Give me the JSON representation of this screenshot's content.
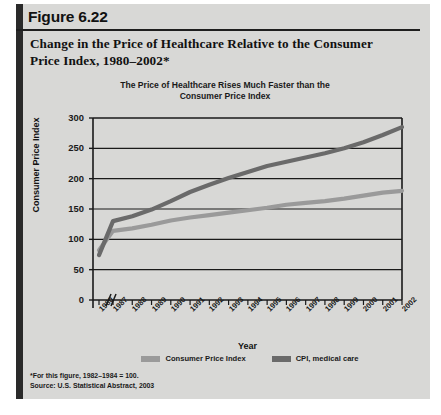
{
  "figure": {
    "number": "Figure 6.22",
    "caption": "Change in the Price of Healthcare Relative to the Consumer Price Index, 1980–2002*"
  },
  "chart_title_line1": "The Price of Healthcare Rises Much Faster than the",
  "chart_title_line2": "Consumer Price Index",
  "footnotes": {
    "note": "*For this figure, 1982–1984 = 100.",
    "source": "Source: U.S. Statistical Abstract, 2003"
  },
  "colors": {
    "panel_background": "#d8d8d6",
    "spine": "#2a2a2a",
    "cpi_line": "#9a9a9a",
    "medical_line": "#6a6a6a",
    "axis": "#1a1a1a",
    "text": "#111111"
  },
  "chart_data": {
    "type": "line",
    "title": "The Price of Healthcare Rises Much Faster than the Consumer Price Index",
    "xlabel": "Year",
    "ylabel": "Consumer Price Index",
    "ylim": [
      0,
      300
    ],
    "yticks": [
      0,
      50,
      100,
      150,
      200,
      250,
      300
    ],
    "grid": true,
    "grid_axis": "y",
    "axis_break_after_first_tick": true,
    "legend_position": "bottom",
    "categories": [
      "1980",
      "1987",
      "1988",
      "1989",
      "1990",
      "1991",
      "1992",
      "1993",
      "1994",
      "1995",
      "1996",
      "1997",
      "1998",
      "1999",
      "2000",
      "2001",
      "2002"
    ],
    "series": [
      {
        "name": "Consumer Price Index",
        "color": "#9a9a9a",
        "values": [
          82,
          114,
          118,
          124,
          131,
          136,
          140,
          144,
          148,
          152,
          157,
          160,
          163,
          167,
          172,
          177,
          180
        ]
      },
      {
        "name": "CPI, medical care",
        "color": "#6a6a6a",
        "values": [
          74,
          130,
          138,
          149,
          163,
          178,
          190,
          201,
          211,
          221,
          228,
          235,
          242,
          250,
          260,
          272,
          285
        ]
      }
    ]
  },
  "legend": [
    {
      "label": "Consumer Price Index",
      "color": "#9a9a9a"
    },
    {
      "label": "CPI, medical care",
      "color": "#6a6a6a"
    }
  ]
}
